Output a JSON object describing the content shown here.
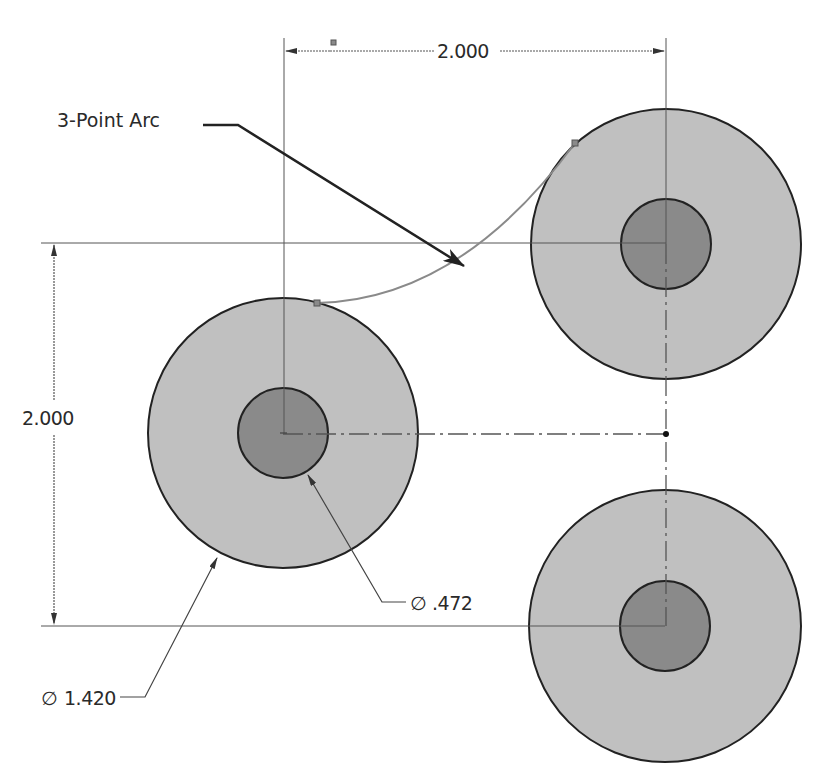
{
  "drawing": {
    "colors": {
      "background": "#ffffff",
      "outer_fill": "#c0c0c0",
      "inner_fill": "#8a8a8a",
      "outline": "#222222",
      "arc": "#8a8a8a"
    },
    "circles": [
      {
        "name": "left-boss",
        "cx": 283,
        "cy": 433,
        "outer_r": 135,
        "inner_r": 45
      },
      {
        "name": "top-right-boss",
        "cx": 666,
        "cy": 244,
        "outer_r": 135,
        "inner_r": 45
      },
      {
        "name": "bottom-right-boss",
        "cx": 665,
        "cy": 626,
        "outer_r": 136,
        "inner_r": 45
      }
    ],
    "dimensions": {
      "horizontal": {
        "value": "2.000"
      },
      "vertical": {
        "value": "2.000"
      },
      "outer_diameter": {
        "symbol": "∅",
        "value": "1.420"
      },
      "inner_diameter": {
        "symbol": "∅",
        "value": ".472"
      }
    },
    "callout": {
      "label": "3-Point Arc"
    },
    "arc": {
      "start": [
        317,
        303
      ],
      "end": [
        575,
        143
      ]
    }
  }
}
